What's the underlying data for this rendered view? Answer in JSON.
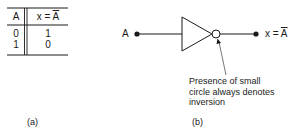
{
  "figure_a": {
    "caption": "(a)",
    "truth_table": {
      "headers": {
        "input": "A",
        "output_prefix": "x = ",
        "output_var": "A"
      },
      "rows": [
        {
          "A": "0",
          "x": "1"
        },
        {
          "A": "1",
          "x": "0"
        }
      ]
    }
  },
  "figure_b": {
    "caption": "(b)",
    "input_label": "A",
    "output_label_prefix": "x = ",
    "output_label_var": "A",
    "gate_type": "NOT (inverter)",
    "annotation": {
      "line1": "Presence of small",
      "line2": "circle always denotes",
      "line3": "inversion"
    }
  },
  "colors": {
    "ink": "#1a1a1a",
    "background": "#ffffff"
  }
}
